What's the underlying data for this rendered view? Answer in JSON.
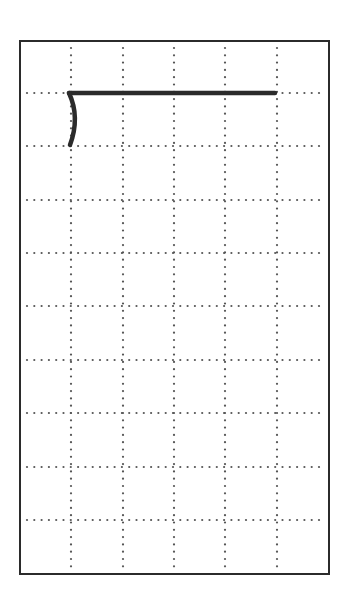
{
  "diagram": {
    "type": "writing-practice-grid",
    "frame": {
      "left": 20,
      "top": 41,
      "right": 328,
      "bottom": 573,
      "border_color": "#2b2b2b"
    },
    "grid": {
      "columns": 6,
      "rows": 10,
      "dot_color": "#555555",
      "vertical_lines_x": [
        71,
        123,
        174,
        225,
        277
      ],
      "horizontal_lines_y": [
        93,
        146,
        200,
        253,
        306,
        360,
        413,
        467,
        520
      ]
    },
    "strokes": [
      {
        "name": "horizontal-stroke",
        "path": "M69 93 L275 93",
        "width": 4.5,
        "color": "#2b2b2b"
      },
      {
        "name": "curved-vertical-stroke",
        "path": "M69 93 C76 108 77 126 70 145",
        "width": 4.5,
        "color": "#2b2b2b"
      }
    ]
  }
}
